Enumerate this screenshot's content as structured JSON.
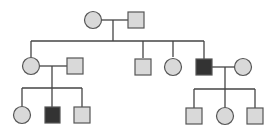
{
  "diagram": {
    "type": "pedigree",
    "title": "",
    "colors": {
      "unaffected_fill": "#d9d9d9",
      "affected_fill": "#333333",
      "stroke": "#555555",
      "line": "#444444"
    },
    "generations": [
      {
        "label": "I",
        "members": [
          {
            "id": "I-1",
            "sex": "female",
            "affected": false
          },
          {
            "id": "I-2",
            "sex": "male",
            "affected": false
          }
        ]
      },
      {
        "label": "II",
        "members": [
          {
            "id": "II-1",
            "sex": "female",
            "affected": false
          },
          {
            "id": "II-1-spouse",
            "sex": "male",
            "affected": false
          },
          {
            "id": "II-2",
            "sex": "male",
            "affected": false
          },
          {
            "id": "II-3",
            "sex": "female",
            "affected": false
          },
          {
            "id": "II-4",
            "sex": "male",
            "affected": true
          },
          {
            "id": "II-4-spouse",
            "sex": "female",
            "affected": false
          }
        ]
      },
      {
        "label": "III",
        "members": [
          {
            "id": "III-1",
            "sex": "female",
            "affected": false
          },
          {
            "id": "III-2",
            "sex": "male",
            "affected": true
          },
          {
            "id": "III-3",
            "sex": "male",
            "affected": false
          },
          {
            "id": "III-4",
            "sex": "male",
            "affected": false
          },
          {
            "id": "III-5",
            "sex": "female",
            "affected": false
          },
          {
            "id": "III-6",
            "sex": "male",
            "affected": false
          }
        ]
      }
    ]
  }
}
